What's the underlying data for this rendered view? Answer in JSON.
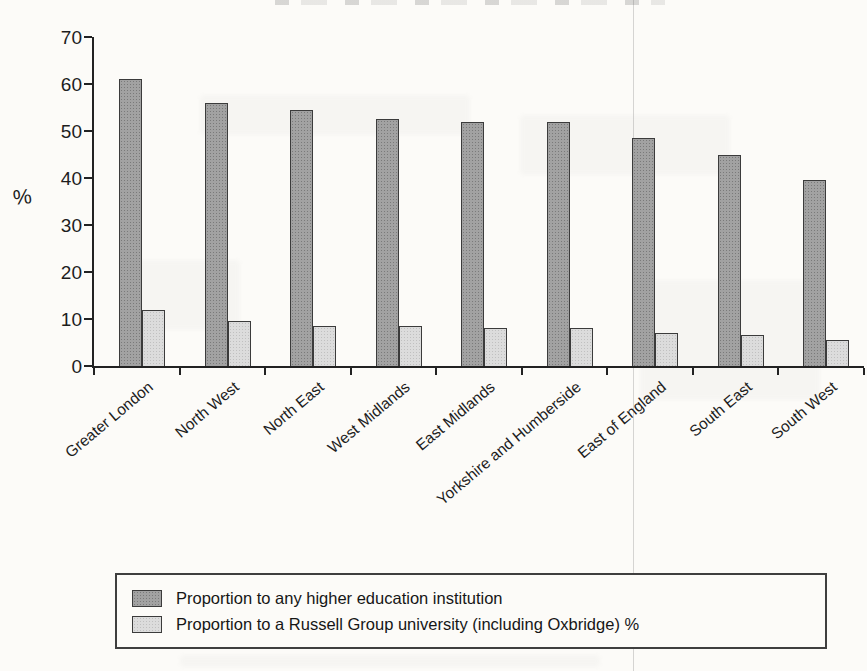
{
  "page": {
    "background_color": "#fcfbf8",
    "ink_color": "#1d1d1d"
  },
  "legend": {
    "items": [
      {
        "label": "Proportion to any higher education institution",
        "color": "#a2a2a2"
      },
      {
        "label": "Proportion to a Russell Group university (including Oxbridge) %",
        "color": "#dcdcdc"
      }
    ]
  },
  "chart_data": {
    "type": "bar",
    "categories": [
      "Greater London",
      "North West",
      "North East",
      "West Midlands",
      "East Midlands",
      "Yorkshire and Humberside",
      "East of England",
      "South East",
      "South West"
    ],
    "series": [
      {
        "name": "Proportion to any higher education institution",
        "color": "#a2a2a2",
        "values": [
          61,
          56,
          54.5,
          52.5,
          52,
          52,
          48.5,
          45,
          39.5
        ]
      },
      {
        "name": "Proportion to a Russell Group university (including Oxbridge) %",
        "color": "#dcdcdc",
        "values": [
          12,
          9.5,
          8.5,
          8.5,
          8,
          8,
          7,
          6.5,
          5.5
        ]
      }
    ],
    "title": "",
    "xlabel": "",
    "ylabel": "%",
    "ylim": [
      0,
      70
    ],
    "y_ticks": [
      0,
      10,
      20,
      30,
      40,
      50,
      60,
      70
    ],
    "grid": false,
    "legend_position": "bottom",
    "bar_label_rotation_deg": -40
  }
}
